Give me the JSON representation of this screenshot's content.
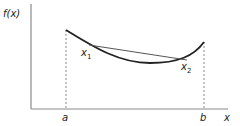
{
  "diagram": {
    "y_axis_label": "f(x)",
    "x_axis_label": "x",
    "interval": {
      "left_label": "a",
      "right_label": "b"
    },
    "points": [
      {
        "id": "x1",
        "base": "x",
        "sub": "1"
      },
      {
        "id": "x2",
        "base": "x",
        "sub": "2"
      }
    ],
    "colors": {
      "ink": "#222222",
      "axis": "#7a7a7a",
      "dashed": "#8a8a8a",
      "chord": "#555555"
    }
  }
}
